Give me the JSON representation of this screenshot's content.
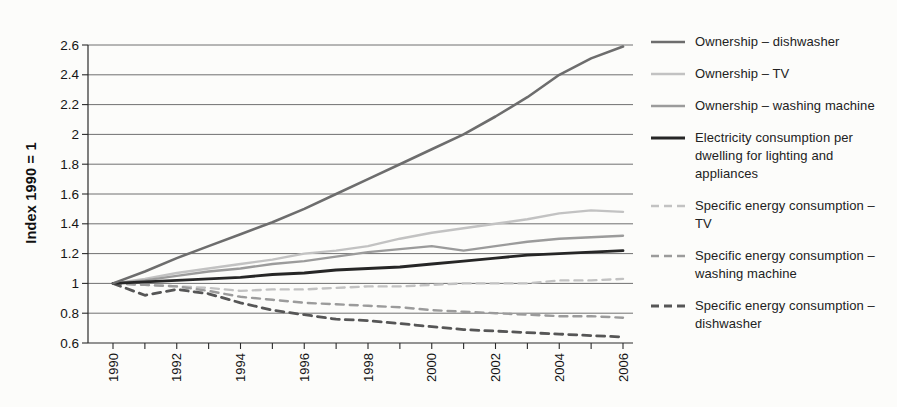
{
  "page": {
    "background": "#fcfcfa"
  },
  "chart_data": {
    "type": "line",
    "title": "",
    "xlabel": "",
    "ylabel": "Index 1990 = 1",
    "x": [
      1990,
      1991,
      1992,
      1993,
      1994,
      1995,
      1996,
      1997,
      1998,
      1999,
      2000,
      2001,
      2002,
      2003,
      2004,
      2005,
      2006
    ],
    "x_tick_labels": [
      "1990",
      "1992",
      "1994",
      "1996",
      "1998",
      "2000",
      "2002",
      "2004",
      "2006"
    ],
    "x_label_every": 2,
    "ylim": [
      0.6,
      2.6
    ],
    "y_ticks": [
      0.6,
      0.8,
      1,
      1.2,
      1.4,
      1.6,
      1.8,
      2,
      2.2,
      2.4,
      2.6
    ],
    "y_tick_labels": [
      "0.6",
      "0.8",
      "1",
      "1.2",
      "1.4",
      "1.6",
      "1.8",
      "2",
      "2.2",
      "2.4",
      "2.6"
    ],
    "grid": "horizontal",
    "legend_position": "right",
    "axis_color": "#2a2a2a",
    "grid_color": "#4d4d4d",
    "series": [
      {
        "name": "Ownership – dishwasher",
        "line_style": "solid",
        "color": "#6d6d6d",
        "stroke_width": 2.6,
        "values": [
          1.0,
          1.08,
          1.17,
          1.25,
          1.33,
          1.41,
          1.5,
          1.6,
          1.7,
          1.8,
          1.9,
          2.0,
          2.12,
          2.25,
          2.4,
          2.51,
          2.59
        ]
      },
      {
        "name": "Ownership – TV",
        "line_style": "solid",
        "color": "#c2c2c2",
        "stroke_width": 2.4,
        "values": [
          1.0,
          1.03,
          1.07,
          1.1,
          1.13,
          1.16,
          1.2,
          1.22,
          1.25,
          1.3,
          1.34,
          1.37,
          1.4,
          1.43,
          1.47,
          1.49,
          1.48
        ]
      },
      {
        "name": "Ownership – washing machine",
        "line_style": "solid",
        "color": "#9b9b9b",
        "stroke_width": 2.4,
        "values": [
          1.0,
          1.02,
          1.05,
          1.08,
          1.1,
          1.13,
          1.15,
          1.18,
          1.21,
          1.23,
          1.25,
          1.22,
          1.25,
          1.28,
          1.3,
          1.31,
          1.32
        ]
      },
      {
        "name": "Electricity consumption per dwelling for lighting and appliances",
        "line_style": "solid",
        "color": "#262626",
        "stroke_width": 2.8,
        "values": [
          1.0,
          1.01,
          1.02,
          1.03,
          1.04,
          1.06,
          1.07,
          1.09,
          1.1,
          1.11,
          1.13,
          1.15,
          1.17,
          1.19,
          1.2,
          1.21,
          1.22
        ]
      },
      {
        "name": "Specific energy consumption – TV",
        "line_style": "dashed",
        "color": "#c2c2c2",
        "stroke_width": 2.4,
        "values": [
          1.0,
          0.99,
          0.98,
          0.97,
          0.95,
          0.96,
          0.96,
          0.97,
          0.98,
          0.98,
          0.99,
          1.0,
          1.0,
          1.0,
          1.02,
          1.02,
          1.03
        ]
      },
      {
        "name": "Specific energy consumption – washing machine",
        "line_style": "dashed",
        "color": "#9b9b9b",
        "stroke_width": 2.4,
        "values": [
          1.0,
          0.99,
          0.98,
          0.95,
          0.91,
          0.89,
          0.87,
          0.86,
          0.85,
          0.84,
          0.82,
          0.81,
          0.8,
          0.79,
          0.78,
          0.78,
          0.77
        ]
      },
      {
        "name": "Specific energy consumption – dishwasher",
        "line_style": "dashed",
        "color": "#565656",
        "stroke_width": 2.8,
        "values": [
          1.0,
          0.92,
          0.96,
          0.93,
          0.87,
          0.82,
          0.79,
          0.76,
          0.75,
          0.73,
          0.71,
          0.69,
          0.68,
          0.67,
          0.66,
          0.65,
          0.64
        ]
      }
    ]
  }
}
